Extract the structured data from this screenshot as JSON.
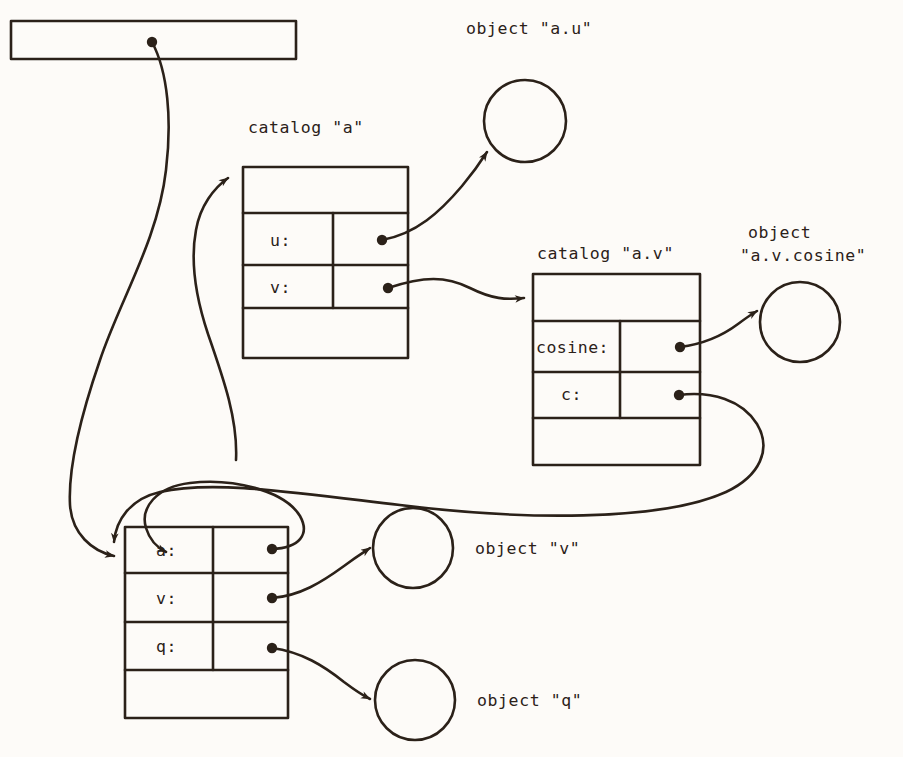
{
  "diagram": {
    "ink_color": "#2b2119",
    "background_color": "#fdfbf8",
    "labels": {
      "object_au": "object \"a.u\"",
      "catalog_a": "catalog \"a\"",
      "catalog_av": "catalog \"a.v\"",
      "object_avcosine_line1": "object",
      "object_avcosine_line2": "\"a.v.cosine\"",
      "object_v": "object \"v\"",
      "object_q": "object \"q\""
    },
    "tables": {
      "top_bar": {
        "name": "top-bar",
        "rows": []
      },
      "catalog_a": {
        "name": "catalog-a",
        "rows": [
          {
            "key": "",
            "value": ""
          },
          {
            "key": "u:",
            "value": ""
          },
          {
            "key": "v:",
            "value": ""
          },
          {
            "key": "",
            "value": ""
          }
        ]
      },
      "catalog_av": {
        "name": "catalog-a-v",
        "rows": [
          {
            "key": "",
            "value": ""
          },
          {
            "key": "cosine:",
            "value": ""
          },
          {
            "key": "c:",
            "value": ""
          },
          {
            "key": "",
            "value": ""
          }
        ]
      },
      "working_catalog": {
        "name": "working-catalog",
        "rows": [
          {
            "key": "a:",
            "value": ""
          },
          {
            "key": "v:",
            "value": ""
          },
          {
            "key": "q:",
            "value": ""
          },
          {
            "key": "",
            "value": ""
          }
        ]
      }
    },
    "circles": [
      {
        "name": "object-a-u",
        "label": "object \"a.u\""
      },
      {
        "name": "object-a-v-cosine",
        "label": "object \"a.v.cosine\""
      },
      {
        "name": "object-v",
        "label": "object \"v\""
      },
      {
        "name": "object-q",
        "label": "object \"q\""
      }
    ],
    "pointers": [
      {
        "name": "top-bar-to-working-catalog",
        "from": "top-bar",
        "to": "working-catalog"
      },
      {
        "name": "catalog-a-u-to-object-a-u",
        "from": "catalog-a.u",
        "to": "object-a-u"
      },
      {
        "name": "catalog-a-v-to-catalog-a-v-table",
        "from": "catalog-a.v",
        "to": "catalog-a-v"
      },
      {
        "name": "catalog-av-cosine-to-object",
        "from": "catalog-a-v.cosine",
        "to": "object-a-v-cosine"
      },
      {
        "name": "catalog-av-c-to-working-catalog",
        "from": "catalog-a-v.c",
        "to": "working-catalog"
      },
      {
        "name": "working-catalog-a-to-catalog-a",
        "from": "working-catalog.a",
        "to": "catalog-a"
      },
      {
        "name": "working-catalog-v-to-object-v",
        "from": "working-catalog.v",
        "to": "object-v"
      },
      {
        "name": "working-catalog-q-to-object-q",
        "from": "working-catalog.q",
        "to": "object-q"
      }
    ]
  }
}
